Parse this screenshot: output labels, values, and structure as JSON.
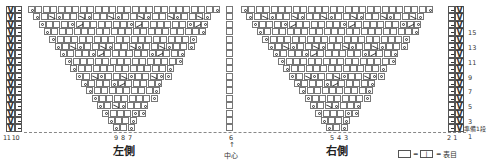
{
  "chart": {
    "left_side_label": "左側",
    "right_side_label": "右側",
    "center_label": "中心",
    "center_arrow": "↑",
    "prep_row_label": "準備1段",
    "bottom_stitch_numbers_left_edge": "11 10",
    "bottom_stitch_numbers_left": [
      "9",
      "8",
      "7"
    ],
    "bottom_stitch_number_center": "6",
    "bottom_stitch_numbers_right": [
      "5",
      "4",
      "3"
    ],
    "bottom_stitch_numbers_right_edge": "2 1",
    "row_numbers": [
      "15",
      "13",
      "11",
      "9",
      "7",
      "5",
      "3",
      "1"
    ],
    "legend": {
      "equals_1": "=",
      "knit_symbol": "|",
      "equals_2": "=",
      "meaning": "表目"
    },
    "symbols": {
      "edge_slip": "V",
      "edge_purl": "−",
      "yarn_over": "o",
      "right_decrease": "λ",
      "left_decrease": "入"
    },
    "colors": {
      "grid_line": "#777777",
      "text": "#222222",
      "background": "#ffffff"
    }
  }
}
